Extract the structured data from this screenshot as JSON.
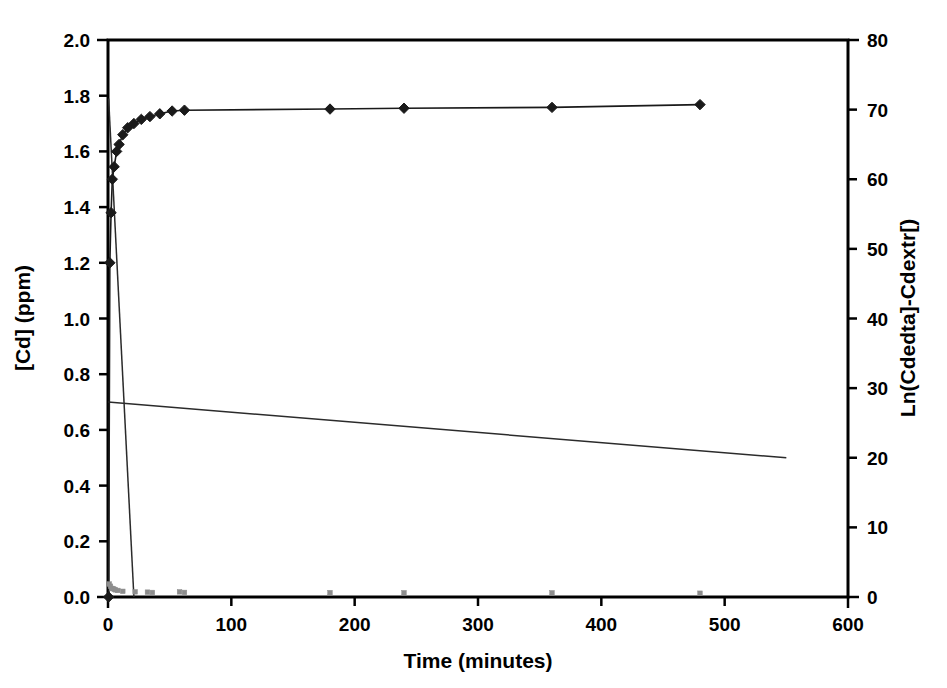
{
  "chart_data": {
    "type": "scatter",
    "title": "",
    "xlabel": "Time (minutes)",
    "ylabel": "[Cd] (ppm)",
    "y2label": "Ln(Cdedta]-Cdextr[)",
    "xlim": [
      0,
      600
    ],
    "ylim": [
      0.0,
      2.0
    ],
    "y2lim": [
      0,
      80
    ],
    "grid": false,
    "legend": "none",
    "xticks": [
      0,
      100,
      200,
      300,
      400,
      500,
      600
    ],
    "xtick_labels": [
      "0",
      "100",
      "200",
      "300",
      "400",
      "500",
      "600"
    ],
    "yticks": [
      0.0,
      0.2,
      0.4,
      0.6,
      0.8,
      1.0,
      1.2,
      1.4,
      1.6,
      1.8,
      2.0
    ],
    "ytick_labels": [
      "0.0",
      "0.2",
      "0.4",
      "0.6",
      "0.8",
      "1.0",
      "1.2",
      "1.4",
      "1.6",
      "1.8",
      "2.0"
    ],
    "y2ticks": [
      0,
      10,
      20,
      30,
      40,
      50,
      60,
      70,
      80
    ],
    "y2tick_labels": [
      "0",
      "10",
      "20",
      "30",
      "40",
      "50",
      "60",
      "70",
      "80"
    ],
    "series": [
      {
        "name": "Cd concentration",
        "marker": "diamond",
        "marker_color": "#1a1a1a",
        "line_color": "#1a1a1a",
        "axis": "left",
        "connected": true,
        "points": [
          {
            "x": 0.5,
            "y": 0.0
          },
          {
            "x": 1.5,
            "y": 1.2
          },
          {
            "x": 2.5,
            "y": 1.38
          },
          {
            "x": 3.5,
            "y": 1.5
          },
          {
            "x": 5.0,
            "y": 1.545
          },
          {
            "x": 7.0,
            "y": 1.6
          },
          {
            "x": 9.0,
            "y": 1.625
          },
          {
            "x": 12.0,
            "y": 1.66
          },
          {
            "x": 16.0,
            "y": 1.685
          },
          {
            "x": 21.0,
            "y": 1.7
          },
          {
            "x": 27.0,
            "y": 1.715
          },
          {
            "x": 34.0,
            "y": 1.725
          },
          {
            "x": 42.0,
            "y": 1.735
          },
          {
            "x": 52.0,
            "y": 1.745
          },
          {
            "x": 62.0,
            "y": 1.748
          },
          {
            "x": 180.0,
            "y": 1.752
          },
          {
            "x": 240.0,
            "y": 1.755
          },
          {
            "x": 360.0,
            "y": 1.758
          },
          {
            "x": 480.0,
            "y": 1.768
          }
        ]
      },
      {
        "name": "Ln(Cdedta-Cdextr)",
        "marker": "square",
        "marker_color": "#8d8d8d",
        "axis": "right",
        "connected": false,
        "points": [
          {
            "x": 1.0,
            "y": 1.86
          },
          {
            "x": 2.0,
            "y": 1.545
          },
          {
            "x": 3.0,
            "y": 1.24
          },
          {
            "x": 4.0,
            "y": 1.215
          },
          {
            "x": 5.0,
            "y": 1.1
          },
          {
            "x": 6.0,
            "y": 1.03
          },
          {
            "x": 8.0,
            "y": 0.94
          },
          {
            "x": 12.0,
            "y": 0.815
          },
          {
            "x": 22.0,
            "y": 0.745
          },
          {
            "x": 32.0,
            "y": 0.695
          },
          {
            "x": 36.0,
            "y": 0.65
          },
          {
            "x": 58.0,
            "y": 0.74
          },
          {
            "x": 62.0,
            "y": 0.655
          },
          {
            "x": 180.0,
            "y": 0.63
          },
          {
            "x": 240.0,
            "y": 0.61
          },
          {
            "x": 360.0,
            "y": 0.6
          },
          {
            "x": 480.0,
            "y": 0.54
          }
        ]
      }
    ],
    "fit_lines": [
      {
        "name": "steep-initial-fit",
        "x1": 0.5,
        "y1": 1.79,
        "x2": 21.0,
        "y2": 0.0,
        "axis": "left"
      },
      {
        "name": "shallow-long-term-fit",
        "x1": 0.0,
        "y1": 0.7,
        "x2": 550.0,
        "y2": 0.5,
        "axis": "left"
      }
    ]
  }
}
